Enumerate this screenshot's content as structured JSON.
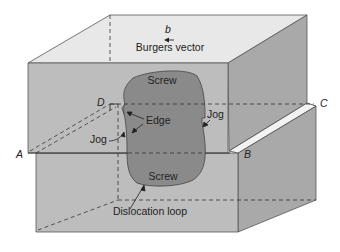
{
  "figure": {
    "labels": {
      "burgers_symbol": "b",
      "burgers_vector": "Burgers vector",
      "screw_top": "Screw",
      "screw_bottom": "Screw",
      "edge": "Edge",
      "jog_left": "Jog",
      "jog_right": "Jog",
      "dislocation_loop": "Dislocation loop",
      "corner_a": "A",
      "corner_b": "B",
      "corner_c": "C",
      "corner_d": "D"
    },
    "colors": {
      "top_face": "#e6e6e6",
      "front_face": "#bdbdbd",
      "side_face": "#a9a9a9",
      "loop_fill": "#8a8a8a",
      "outline": "#444444",
      "background": "#ffffff"
    }
  }
}
